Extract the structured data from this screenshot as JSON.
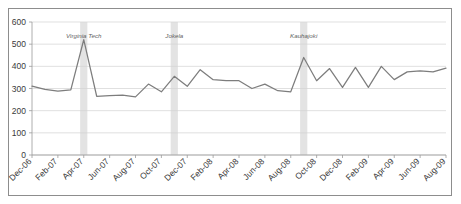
{
  "figure": {
    "clipped_caption_fragment": "",
    "background_color": "#ffffff",
    "border_color": "#8d8d8d"
  },
  "chart_data": {
    "type": "line",
    "title": "",
    "subtitle": "",
    "xlabel": "",
    "ylabel": "",
    "ylim": [
      0,
      600
    ],
    "ytick_step": 100,
    "grid": true,
    "legend": false,
    "line_color": "#7d7d7d",
    "band_color": "#cccccc",
    "ytick_labels": [
      "0",
      "100",
      "200",
      "300",
      "400",
      "500",
      "600"
    ],
    "ytick_values": [
      0,
      100,
      200,
      300,
      400,
      500,
      600
    ],
    "xtick_labels": [
      "Dec-06",
      "Feb-07",
      "Apr-07",
      "Jun-07",
      "Aug-07",
      "Oct-07",
      "Dec-07",
      "Feb-08",
      "Apr-08",
      "Jun-08",
      "Aug-08",
      "Oct-08",
      "Dec-08",
      "Feb-09",
      "Apr-09",
      "Jun-09",
      "Aug-09"
    ],
    "x": [
      "Dec-06",
      "Jan-07",
      "Feb-07",
      "Mar-07",
      "Apr-07",
      "May-07",
      "Jun-07",
      "Jul-07",
      "Aug-07",
      "Sep-07",
      "Oct-07",
      "Nov-07",
      "Dec-07",
      "Jan-08",
      "Feb-08",
      "Mar-08",
      "Apr-08",
      "May-08",
      "Jun-08",
      "Jul-08",
      "Aug-08",
      "Sep-08",
      "Oct-08",
      "Nov-08",
      "Dec-08",
      "Jan-09",
      "Feb-09",
      "Mar-09",
      "Apr-09",
      "May-09",
      "Jun-09",
      "Jul-09",
      "Aug-09"
    ],
    "values": [
      311,
      296,
      288,
      294,
      520,
      265,
      268,
      270,
      262,
      320,
      285,
      355,
      310,
      385,
      340,
      335,
      335,
      300,
      320,
      290,
      285,
      440,
      335,
      390,
      305,
      395,
      305,
      400,
      340,
      375,
      380,
      375,
      392
    ],
    "annotations": [
      {
        "label": "Virginia Tech",
        "x": "Apr-07",
        "index": 4
      },
      {
        "label": "Jokela",
        "x": "Nov-07",
        "index": 11
      },
      {
        "label": "Kauhajoki",
        "x": "Sep-08",
        "index": 21
      }
    ]
  }
}
